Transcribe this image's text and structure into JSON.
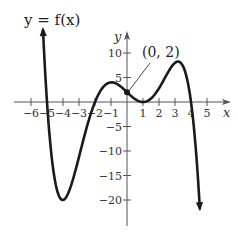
{
  "chart_data": {
    "type": "line",
    "title": "y = f(x)",
    "xlabel": "x",
    "ylabel": "y",
    "xlim": [
      -6.3,
      6.3
    ],
    "ylim": [
      -26,
      14
    ],
    "grid": false,
    "x_ticks": [
      -6,
      -5,
      -4,
      -3,
      -2,
      -1,
      1,
      2,
      3,
      4,
      5
    ],
    "x_tick_labels": [
      "−6",
      "−5",
      "−4",
      "−3",
      "−2",
      "−1",
      "1",
      "2",
      "3",
      "4",
      "5"
    ],
    "y_ticks": [
      10,
      5,
      -5,
      -10,
      -15,
      -20
    ],
    "y_tick_labels": [
      "10",
      "5",
      "−5",
      "−10",
      "−15",
      "−20"
    ],
    "series": [
      {
        "name": "f(x)",
        "formula": "-0.05(x+5)(x+2)(x-1)^2(x-4)",
        "x": [
          -5.25,
          -5,
          -4.5,
          -4,
          -3.5,
          -3,
          -2.5,
          -2,
          -1.5,
          -1,
          -0.5,
          0,
          0.5,
          1,
          1.5,
          2,
          2.5,
          3,
          3.5,
          4,
          4.3,
          4.55
        ],
        "y": [
          14.7,
          0,
          -15.1,
          -20,
          -16.6,
          -9.6,
          -3.5,
          0,
          2.7,
          4,
          3.8,
          2,
          0.5,
          0,
          0.7,
          2.8,
          5.5,
          8,
          7.1,
          0,
          -7.9,
          -22
        ]
      }
    ],
    "annotations": [
      {
        "text": "(0, 2)",
        "point": [
          0,
          2
        ]
      }
    ],
    "key_points": {
      "x_intercepts": [
        -5,
        -2,
        1,
        4
      ],
      "y_intercept": 2,
      "local_min": [
        [
          -4,
          -20
        ],
        [
          1,
          0
        ]
      ],
      "local_max": [
        [
          -1,
          4
        ],
        [
          3,
          8
        ]
      ]
    }
  },
  "labels": {
    "title": "y = f(x)",
    "x_axis": "x",
    "y_axis": "y",
    "point": "(0, 2)"
  },
  "colors": {
    "curve": "#1a1a1a",
    "axis": "#555555",
    "text": "#333333"
  }
}
